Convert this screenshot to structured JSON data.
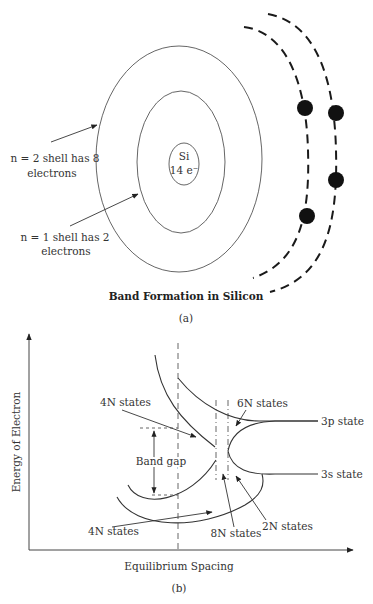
{
  "panel_a": {
    "nucleus": {
      "symbol": "Si",
      "charge": "14 e⁻"
    },
    "shell_labels": [
      {
        "line1": "n = 2 shell has 8",
        "line2": "electrons"
      },
      {
        "line1": "n = 1 shell has 2",
        "line2": "electrons"
      }
    ],
    "valence_electron_count": 4,
    "title": "Band Formation in Silicon",
    "caption": "(a)"
  },
  "panel_b": {
    "y_axis_label": "Energy of Electron",
    "x_axis_label": "Equilibrium Spacing",
    "caption": "(b)",
    "annotations": {
      "upper_4n": "4N states",
      "six_n": "6N states",
      "three_p": "3p state",
      "band_gap": "Band gap",
      "three_s": "3s state",
      "lower_4n": "4N states",
      "eight_n": "8N states",
      "two_n": "2N states"
    }
  },
  "colors": {
    "line": "#333333",
    "electron": "#111111",
    "background": "#ffffff"
  }
}
